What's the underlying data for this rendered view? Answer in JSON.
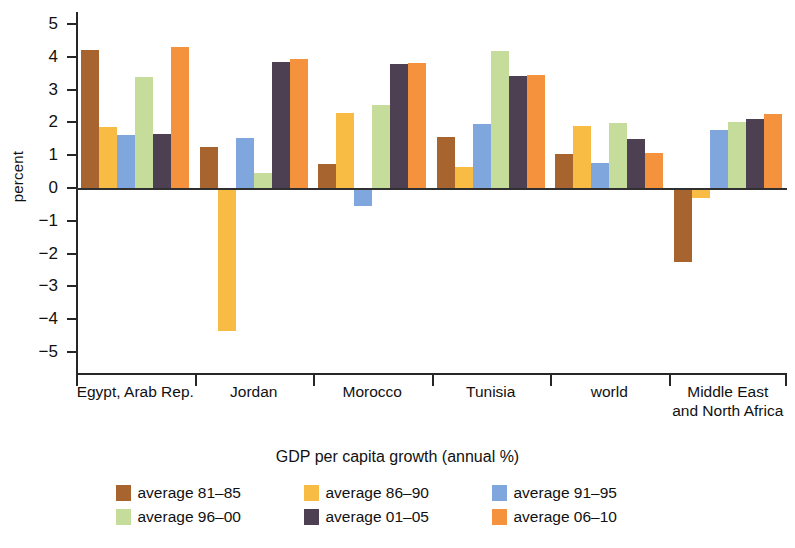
{
  "chart_data": {
    "type": "bar",
    "title": "",
    "xlabel": "GDP per capita growth (annual %)",
    "ylabel": "percent",
    "ylim": [
      -5,
      5
    ],
    "ytick_labels": [
      "5",
      "4",
      "3",
      "2",
      "1",
      "0",
      "−1",
      "−2",
      "−3",
      "−4",
      "−5"
    ],
    "ytick_values": [
      5,
      4,
      3,
      2,
      1,
      0,
      -1,
      -2,
      -3,
      -4,
      -5
    ],
    "grid": false,
    "legend_position": "bottom",
    "categories": [
      "Egypt, Arab Rep.",
      "Jordan",
      "Morocco",
      "Tunisia",
      "world",
      "Middle East\nand North Africa"
    ],
    "series": [
      {
        "name": "average 81–85",
        "color": "#A8642F",
        "values": [
          4.22,
          1.26,
          0.72,
          1.56,
          1.03,
          -2.25
        ]
      },
      {
        "name": "average 86–90",
        "color": "#F8BC44",
        "values": [
          1.87,
          -4.35,
          2.29,
          0.64,
          1.88,
          -0.3
        ]
      },
      {
        "name": "average 91–95",
        "color": "#7FA7DE",
        "values": [
          1.62,
          1.51,
          -0.55,
          1.95,
          0.77,
          1.77
        ]
      },
      {
        "name": "average 96–00",
        "color": "#C6DC9B",
        "values": [
          3.39,
          0.46,
          2.54,
          4.17,
          1.98,
          2.02
        ]
      },
      {
        "name": "average 01–05",
        "color": "#4E4053",
        "values": [
          1.64,
          3.85,
          3.79,
          3.4,
          1.5,
          2.1
        ]
      },
      {
        "name": "average 06–10",
        "color": "#F5923E",
        "values": [
          4.3,
          3.93,
          3.81,
          3.43,
          1.06,
          2.25
        ]
      }
    ]
  }
}
